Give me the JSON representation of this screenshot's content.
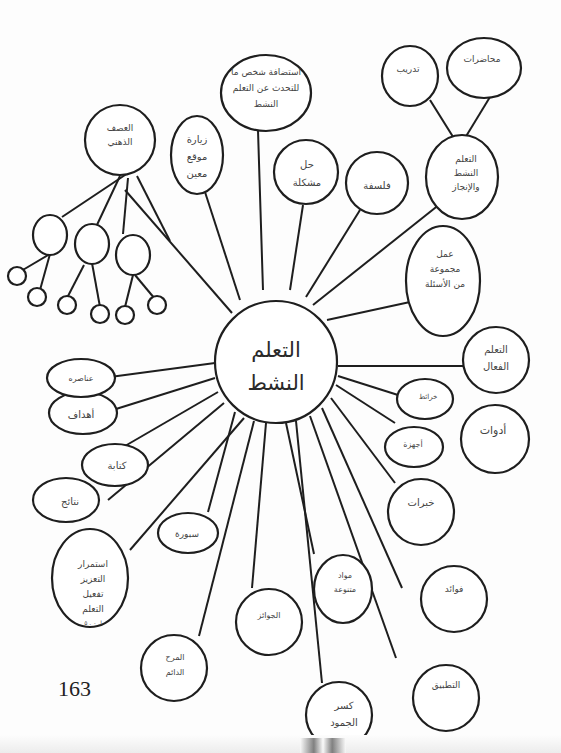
{
  "center": {
    "lines": [
      "التعلم",
      "النشط"
    ]
  },
  "nodes": {
    "guest": {
      "lines": [
        "استضافة شخص ما",
        "للتحدث عن التعلم",
        "النشط"
      ]
    },
    "training": {
      "lines": [
        "تدريب"
      ]
    },
    "lectures": {
      "lines": [
        "محاضرات"
      ]
    },
    "active_achievement": {
      "lines": [
        "التعلم",
        "النشط",
        "والإنجاز"
      ]
    },
    "brainstorm": {
      "lines": [
        "العصف",
        "الذهني"
      ]
    },
    "site_visit": {
      "lines": [
        "زيارة",
        "موقع",
        "معين"
      ]
    },
    "problem_solving": {
      "lines": [
        "حل",
        "مشكلة"
      ]
    },
    "philosophy": {
      "lines": [
        "فلسفة"
      ]
    },
    "question_group": {
      "lines": [
        "عمل",
        "مجموعة",
        "من الأسئلة"
      ]
    },
    "effective_learning": {
      "lines": [
        "التعلم",
        "الفعال"
      ]
    },
    "maps": {
      "lines": [
        "خرائط"
      ]
    },
    "devices": {
      "lines": [
        "أجهزة"
      ]
    },
    "tools": {
      "lines": [
        "أدوات"
      ]
    },
    "experiences": {
      "lines": [
        "خبرات"
      ]
    },
    "benefits": {
      "lines": [
        "فوائد"
      ]
    },
    "application": {
      "lines": [
        "التطبيق"
      ]
    },
    "break_ice": {
      "lines": [
        "كسر",
        "الجمود"
      ]
    },
    "varied_materials": {
      "lines": [
        "مواد",
        "متنوعة"
      ]
    },
    "prizes": {
      "lines": [
        "الجوائز"
      ]
    },
    "ongoing_fun": {
      "lines": [
        "المرح",
        "الدائم"
      ]
    },
    "reinforcement": {
      "lines": [
        "استمرار",
        "التعزيز",
        "تفعيل",
        "التعلم",
        "ا. ٠ . ٥"
      ]
    },
    "whiteboard": {
      "lines": [
        "سبورة"
      ]
    },
    "results": {
      "lines": [
        "نتائج"
      ]
    },
    "writing": {
      "lines": [
        "كتابة"
      ]
    },
    "goals": {
      "lines": [
        "أهداف"
      ]
    },
    "elements": {
      "lines": [
        "عناصره"
      ]
    }
  },
  "page_number": "163"
}
